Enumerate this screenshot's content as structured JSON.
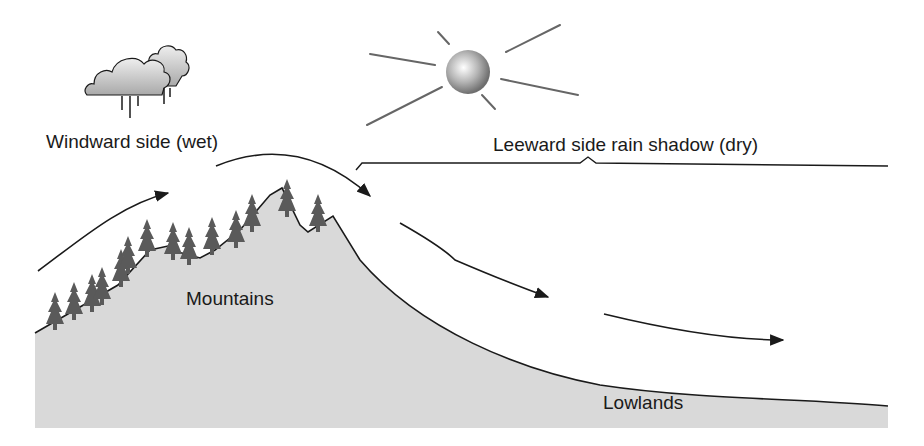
{
  "labels": {
    "windward": "Windward side (wet)",
    "leeward": "Leeward side rain shadow (dry)",
    "mountains": "Mountains",
    "lowlands": "Lowlands"
  },
  "icons": {
    "cloud": "rain-cloud",
    "sun": "sun"
  },
  "colors": {
    "land": "#d9d9d9",
    "tree": "#5a5a5a",
    "line": "#1a1a1a",
    "sun_ray": "#666666"
  }
}
